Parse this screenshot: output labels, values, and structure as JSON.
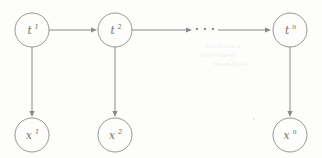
{
  "figure": {
    "kind": "probabilistic-graphical-model-chain",
    "background_color": "#fdfdfc",
    "stroke_color": "#8a8a8a",
    "label_color": "#6f6f6f",
    "width": 322,
    "height": 158
  },
  "nodes": {
    "latent": [
      {
        "id": "t1",
        "base": "t",
        "sup": "1",
        "label": "t¹",
        "cx": 32,
        "cy": 30,
        "r": 17
      },
      {
        "id": "t2",
        "base": "t",
        "sup": "2",
        "label": "t²",
        "cx": 115,
        "cy": 30,
        "r": 17
      },
      {
        "id": "tn",
        "base": "t",
        "sup": "n",
        "label": "tⁿ",
        "cx": 290,
        "cy": 30,
        "r": 17
      }
    ],
    "observed": [
      {
        "id": "x1",
        "base": "x",
        "sup": "1",
        "label": "x¹",
        "cx": 32,
        "cy": 135,
        "r": 17
      },
      {
        "id": "x2",
        "base": "x",
        "sup": "2",
        "label": "x²",
        "cx": 115,
        "cy": 135,
        "r": 17
      },
      {
        "id": "xn",
        "base": "x",
        "sup": "n",
        "label": "xⁿ",
        "cx": 290,
        "cy": 135,
        "r": 17
      }
    ]
  },
  "edges": {
    "horizontal": [
      {
        "id": "t1-to-t2",
        "from": "t1",
        "to": "t2",
        "x1": 49,
        "x2": 97,
        "y": 30,
        "arrow": true
      },
      {
        "id": "t2-to-ellipsis",
        "from": "t2",
        "to": "ellipsis",
        "x1": 132,
        "x2": 192,
        "y": 30,
        "arrow": true
      },
      {
        "id": "ellipsis-to-tn",
        "from": "ellipsis",
        "to": "tn",
        "x1": 218,
        "x2": 271,
        "y": 30,
        "arrow": true
      }
    ],
    "vertical": [
      {
        "id": "t1-to-x1",
        "from": "t1",
        "to": "x1",
        "x": 32,
        "y1": 47,
        "y2": 117,
        "arrow": true
      },
      {
        "id": "t2-to-x2",
        "from": "t2",
        "to": "x2",
        "x": 115,
        "y1": 47,
        "y2": 117,
        "arrow": true
      },
      {
        "id": "tn-to-xn",
        "from": "tn",
        "to": "xn",
        "x": 290,
        "y1": 47,
        "y2": 117,
        "arrow": true
      }
    ]
  },
  "ellipsis": {
    "id": "horizontal-ellipsis",
    "glyph": "…",
    "dots": 3,
    "cy": 29,
    "dot_x": [
      197,
      205,
      213
    ]
  },
  "artifacts": {
    "bleed_lines": [
      {
        "text": "bleed-line-a",
        "x": 206,
        "y": 46
      },
      {
        "text": "bleed-line-b",
        "x": 200,
        "y": 55
      },
      {
        "text": "bleed-line-c",
        "x": 214,
        "y": 64
      }
    ],
    "specks": [
      {
        "x": 253,
        "y": 118
      }
    ]
  }
}
